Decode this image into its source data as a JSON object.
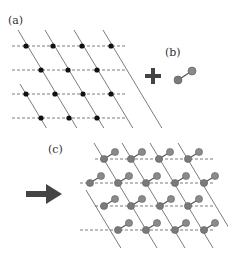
{
  "labels": {
    "a": "(a)",
    "b": "(b)",
    "c": "(c)"
  },
  "colors": {
    "line": "#444444",
    "dot": "#111111",
    "atom": "#7a7a7a",
    "atom_edge": "#555555",
    "plus": "#444444",
    "arrow": "#444444"
  },
  "panel_a": {
    "description": "2D oblique lattice of black dots on dashed horizontal lines and solid diagonal lines",
    "rows_y": [
      46,
      70,
      94,
      118
    ],
    "dots": [
      [
        26,
        46
      ],
      [
        53,
        46
      ],
      [
        82,
        46
      ],
      [
        111,
        46
      ],
      [
        41,
        70
      ],
      [
        68,
        70
      ],
      [
        97,
        70
      ],
      [
        26,
        94
      ],
      [
        55,
        94
      ],
      [
        83,
        94
      ],
      [
        111,
        94
      ],
      [
        41,
        118
      ],
      [
        69,
        118
      ],
      [
        97,
        118
      ]
    ]
  },
  "panel_b": {
    "description": "Diatomic molecule: two grey spheres joined by a bond",
    "plus_symbol": "+"
  },
  "panel_c": {
    "description": "Lattice with a diatomic molecule adsorbed at each site, tilted up-right",
    "rows_y": [
      159,
      183,
      206,
      230
    ],
    "atoms": [
      [
        104,
        159
      ],
      [
        131,
        159
      ],
      [
        159,
        159
      ],
      [
        188,
        159
      ],
      [
        90,
        183
      ],
      [
        118,
        183
      ],
      [
        146,
        183
      ],
      [
        175,
        183
      ],
      [
        204,
        183
      ],
      [
        104,
        206
      ],
      [
        131,
        206
      ],
      [
        160,
        206
      ],
      [
        188,
        206
      ],
      [
        118,
        230
      ],
      [
        146,
        230
      ],
      [
        175,
        230
      ],
      [
        204,
        230
      ]
    ]
  }
}
